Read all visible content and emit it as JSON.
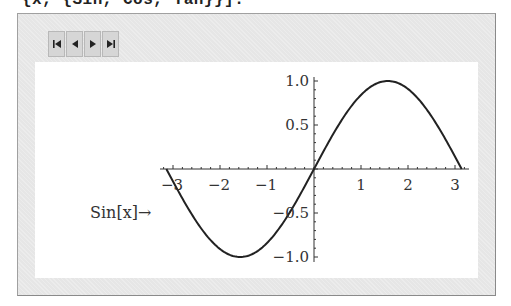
{
  "code": {
    "text": "{x, {Sin, Cos, Tan}}]."
  },
  "controls": {
    "buttons": [
      {
        "name": "first",
        "icon": "skip-to-first-icon"
      },
      {
        "name": "previous",
        "icon": "step-back-icon"
      },
      {
        "name": "next",
        "icon": "step-forward-icon"
      },
      {
        "name": "last",
        "icon": "skip-to-last-icon"
      }
    ]
  },
  "plot": {
    "function_label": "Sin[x]→",
    "x_ticks": [
      "−3",
      "−2",
      "−1",
      "1",
      "2",
      "3"
    ],
    "y_ticks": [
      "1.0",
      "0.5",
      "−0.5",
      "−1.0"
    ]
  },
  "chart_data": {
    "type": "line",
    "title": "",
    "function": "Sin[x]",
    "xlabel": "",
    "ylabel": "",
    "xlim": [
      -3.3,
      3.3
    ],
    "ylim": [
      -1.05,
      1.05
    ],
    "x_ticks": [
      -3,
      -2,
      -1,
      1,
      2,
      3
    ],
    "y_ticks": [
      -1.0,
      -0.5,
      0.5,
      1.0
    ],
    "grid": false,
    "series": [
      {
        "name": "Sin[x]",
        "x": [
          -3.1416,
          -2.3562,
          -1.5708,
          -0.7854,
          0,
          0.7854,
          1.5708,
          2.3562,
          3.1416
        ],
        "values": [
          0,
          -0.7071,
          -1.0,
          -0.7071,
          0,
          0.7071,
          1.0,
          0.7071,
          0
        ]
      }
    ]
  },
  "colors": {
    "frame_bg": "#e6e6e6",
    "panel_bg": "#ffffff",
    "curve": "#222222",
    "axis": "#333333"
  }
}
